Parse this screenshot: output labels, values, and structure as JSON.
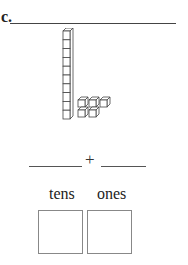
{
  "problem": {
    "label": "c.",
    "answer_line": ""
  },
  "model": {
    "tens_rods": 1,
    "ones_cubes": 5,
    "rod_units": 10
  },
  "equation": {
    "left_blank": "",
    "operator": "+",
    "right_blank": ""
  },
  "place_value": {
    "columns": [
      {
        "label": "tens",
        "value": ""
      },
      {
        "label": "ones",
        "value": ""
      }
    ]
  }
}
